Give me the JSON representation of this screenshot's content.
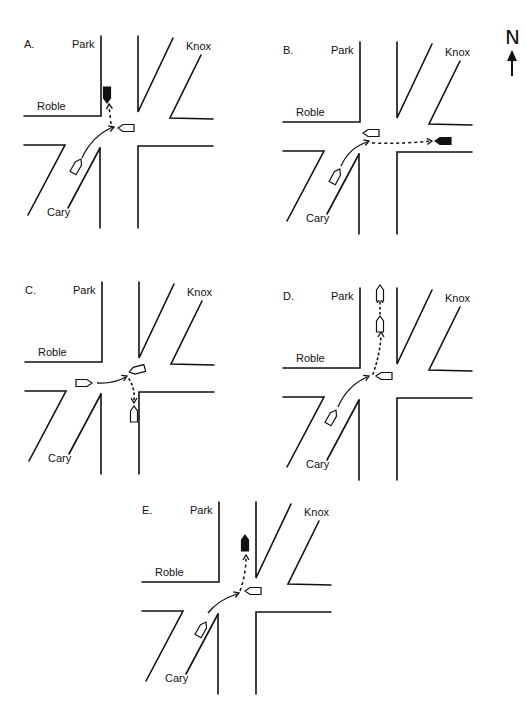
{
  "figure": {
    "compass": {
      "label": "N",
      "icon": "north-arrow-icon"
    },
    "street_names": {
      "park": "Park",
      "knox": "Knox",
      "roble": "Roble",
      "cary": "Cary"
    },
    "panels": [
      {
        "letter": "A.",
        "scenario": "Car from Cary turns right onto Roble eastbound heading; black car heads north on Park",
        "vehicles": [
          {
            "role": "start",
            "fill": "white",
            "location": "Cary southbound lane, heading northeast"
          },
          {
            "role": "intersection",
            "fill": "white",
            "location": "intersection center, facing west"
          },
          {
            "role": "end",
            "fill": "black",
            "location": "Park northbound, facing south"
          }
        ],
        "path_style": "dashed"
      },
      {
        "letter": "B.",
        "scenario": "Car from Cary travels through intersection east on Roble toward black car",
        "vehicles": [
          {
            "role": "start",
            "fill": "white",
            "location": "Cary, heading northeast"
          },
          {
            "role": "intersection",
            "fill": "white",
            "location": "intersection center, facing west"
          },
          {
            "role": "end",
            "fill": "black",
            "location": "Roble east, facing west"
          }
        ],
        "path_style": "dashed"
      },
      {
        "letter": "C.",
        "scenario": "Car from Roble westbound enters intersection, then turns south onto Park",
        "vehicles": [
          {
            "role": "start",
            "fill": "white",
            "location": "Roble west, facing east"
          },
          {
            "role": "intersection",
            "fill": "white",
            "location": "intersection center, facing southwest"
          },
          {
            "role": "end",
            "fill": "white",
            "location": "Park south, facing north"
          }
        ],
        "path_style": "dotted"
      },
      {
        "letter": "D.",
        "scenario": "Car from Cary enters intersection and continues north on Park",
        "vehicles": [
          {
            "role": "start",
            "fill": "white",
            "location": "Cary, heading northeast"
          },
          {
            "role": "intersection",
            "fill": "white",
            "location": "intersection center, facing west"
          },
          {
            "role": "mid",
            "fill": "white",
            "location": "Park north, facing north"
          },
          {
            "role": "end",
            "fill": "white",
            "location": "Park far north, facing north"
          }
        ],
        "path_style": "dotted"
      },
      {
        "letter": "E.",
        "scenario": "Car from Cary enters intersection; black car north on Park",
        "vehicles": [
          {
            "role": "start",
            "fill": "white",
            "location": "Cary, heading northeast"
          },
          {
            "role": "intersection",
            "fill": "white",
            "location": "intersection center, facing west"
          },
          {
            "role": "end",
            "fill": "black",
            "location": "Park north, facing north"
          }
        ],
        "path_style": "dashed"
      }
    ]
  }
}
